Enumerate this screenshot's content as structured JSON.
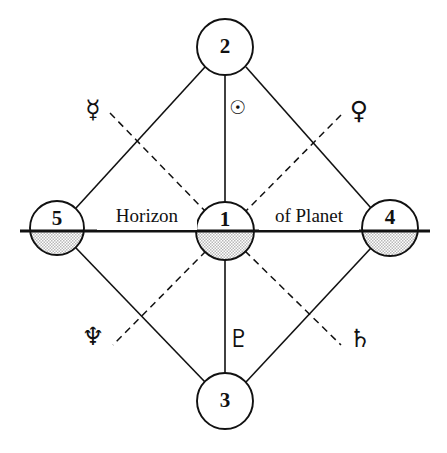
{
  "diagram": {
    "horizon_label_left": "Horizon",
    "horizon_label_right": "of Planet",
    "background_color": "#ffffff",
    "ink_color": "#111111",
    "shade_color": "#c9c9c9",
    "nodes": [
      {
        "id": "1",
        "label": "1",
        "name": "center-node",
        "cx": 225,
        "cy": 231,
        "r": 29,
        "shaded": true
      },
      {
        "id": "2",
        "label": "2",
        "name": "top-node",
        "cx": 225,
        "cy": 47,
        "r": 28,
        "shaded": false
      },
      {
        "id": "3",
        "label": "3",
        "name": "bottom-node",
        "cx": 225,
        "cy": 401,
        "r": 28,
        "shaded": false
      },
      {
        "id": "4",
        "label": "4",
        "name": "right-node",
        "cx": 390,
        "cy": 228,
        "r": 28,
        "shaded": true
      },
      {
        "id": "5",
        "label": "5",
        "name": "left-node",
        "cx": 57,
        "cy": 228,
        "r": 27,
        "shaded": true
      }
    ],
    "symbols": [
      {
        "name": "mercury-symbol",
        "glyph": "☿",
        "label": "Mercury",
        "x": 93,
        "y": 111,
        "size": "large"
      },
      {
        "name": "sun-symbol",
        "glyph": "☉",
        "label": "Sun",
        "x": 238,
        "y": 108,
        "size": "small"
      },
      {
        "name": "venus-symbol",
        "glyph": "♀",
        "label": "Venus",
        "x": 359,
        "y": 112,
        "size": "large"
      },
      {
        "name": "neptune-symbol",
        "glyph": "♆",
        "label": "Neptune",
        "x": 93,
        "y": 338,
        "size": "large"
      },
      {
        "name": "pluto-symbol",
        "glyph": "♇",
        "label": "Pluto",
        "x": 239,
        "y": 340,
        "size": "large"
      },
      {
        "name": "saturn-symbol",
        "glyph": "♄",
        "label": "Saturn",
        "x": 360,
        "y": 340,
        "size": "large"
      }
    ],
    "horizon": {
      "x1": 20,
      "x2": 430,
      "y": 231
    },
    "solid_edges": [
      {
        "name": "edge-5-to-2",
        "x1": 76,
        "y1": 208,
        "x2": 205,
        "y2": 67
      },
      {
        "name": "edge-2-to-4",
        "x1": 246,
        "y1": 67,
        "x2": 371,
        "y2": 208
      },
      {
        "name": "edge-4-to-3",
        "x1": 371,
        "y1": 248,
        "x2": 246,
        "y2": 382
      },
      {
        "name": "edge-3-to-5",
        "x1": 205,
        "y1": 382,
        "x2": 76,
        "y2": 248
      },
      {
        "name": "edge-2-to-1",
        "x1": 225,
        "y1": 75,
        "x2": 225,
        "y2": 202
      },
      {
        "name": "edge-1-to-3",
        "x1": 225,
        "y1": 260,
        "x2": 225,
        "y2": 373
      }
    ],
    "dashed_edges": [
      {
        "name": "dashed-mercury-to-1",
        "x1": 110,
        "y1": 113,
        "x2": 206,
        "y2": 212
      },
      {
        "name": "dashed-venus-to-1",
        "x1": 341,
        "y1": 115,
        "x2": 245,
        "y2": 212
      },
      {
        "name": "dashed-1-to-neptune",
        "x1": 206,
        "y1": 251,
        "x2": 113,
        "y2": 345
      },
      {
        "name": "dashed-1-to-saturn",
        "x1": 245,
        "y1": 251,
        "x2": 341,
        "y2": 345
      }
    ]
  }
}
